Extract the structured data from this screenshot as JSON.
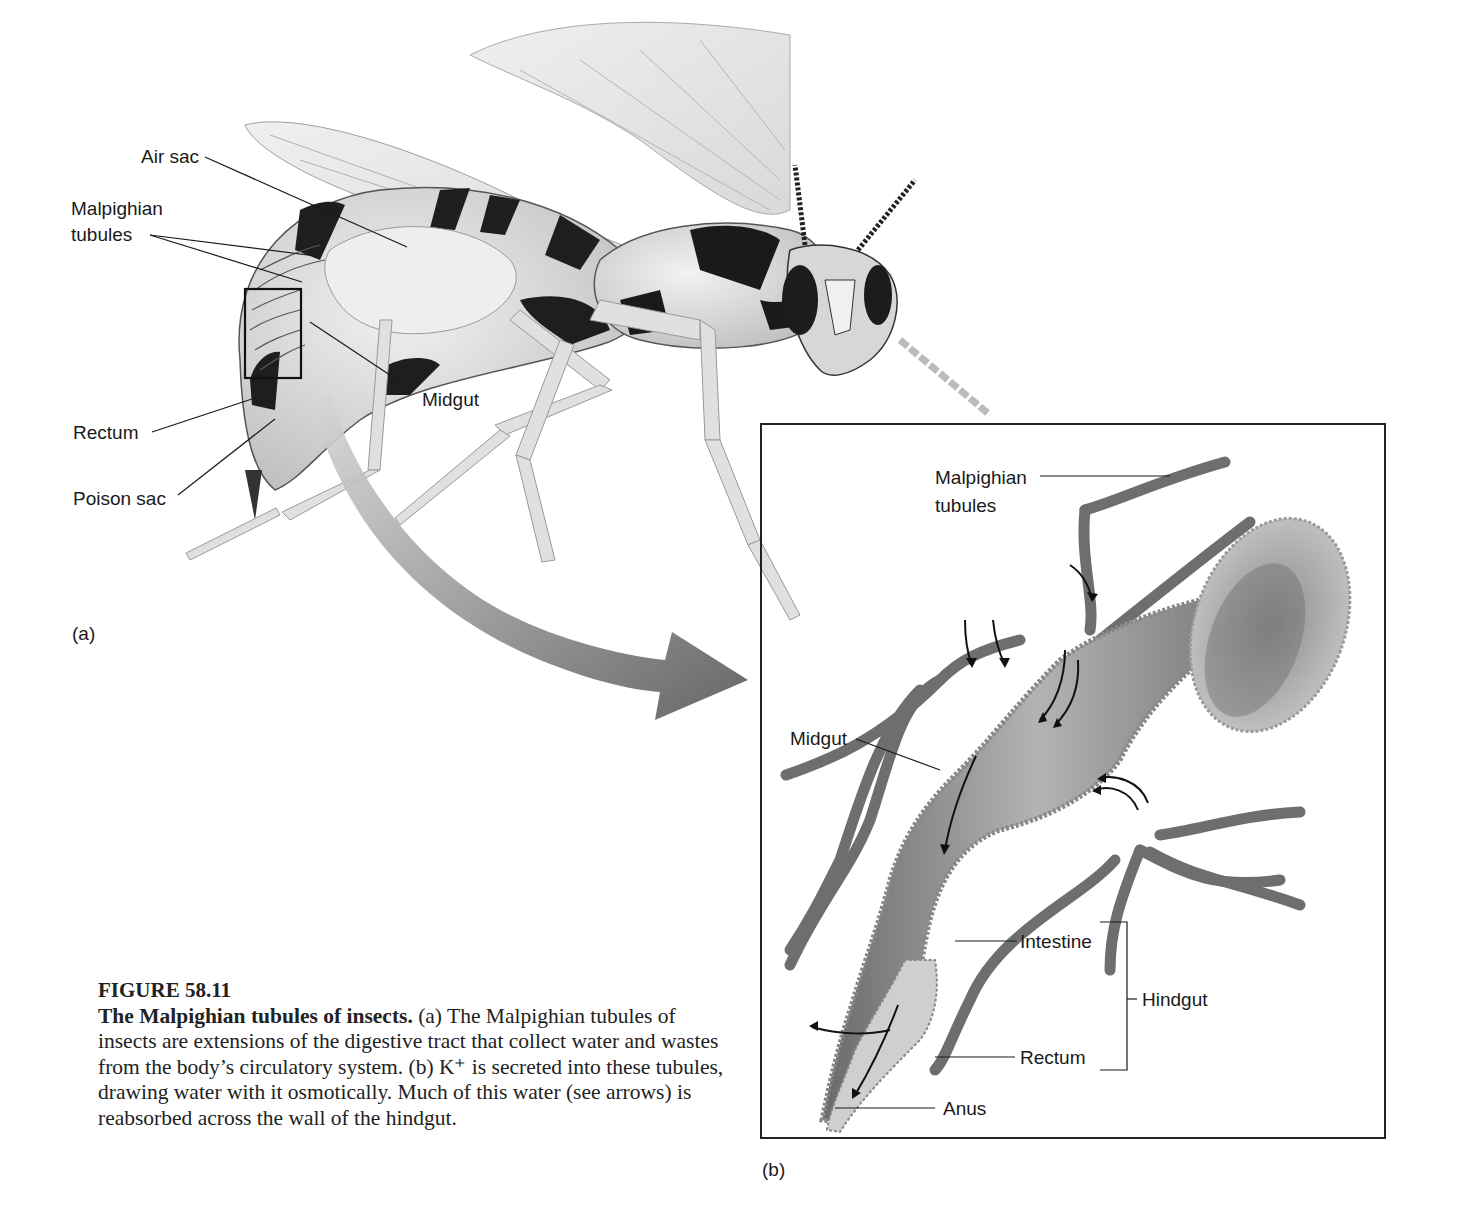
{
  "figure": {
    "number": "FIGURE 58.11",
    "title": "The Malpighian tubules of insects.",
    "caption_parts": {
      "a_marker": "(a)",
      "a_text": " The Malpighian tubules of insects are extensions of the digestive tract that collect water and wastes from the body’s circulatory system. ",
      "b_marker": "(b)",
      "b_text": " K⁺ is secreted into these tubules, drawing water with it osmotically. Much of this water (see arrows) is reabsorbed across the wall of the hindgut."
    }
  },
  "panel_a": {
    "tag": "(a)",
    "subject": "wasp",
    "labels": {
      "air_sac": "Air sac",
      "malpighian_line1": "Malpighian",
      "malpighian_line2": "tubules",
      "midgut": "Midgut",
      "rectum": "Rectum",
      "poison_sac": "Poison sac"
    }
  },
  "panel_b": {
    "tag": "(b)",
    "labels": {
      "malpighian_line1": "Malpighian",
      "malpighian_line2": "tubules",
      "midgut": "Midgut",
      "intestine": "Intestine",
      "rectum": "Rectum",
      "hindgut": "Hindgut",
      "anus": "Anus"
    }
  },
  "colors": {
    "line": "#1a1a1a",
    "tubule": "#6e6e6e",
    "gut": "#8a8a8a",
    "arrow": "#5c5c5c"
  }
}
